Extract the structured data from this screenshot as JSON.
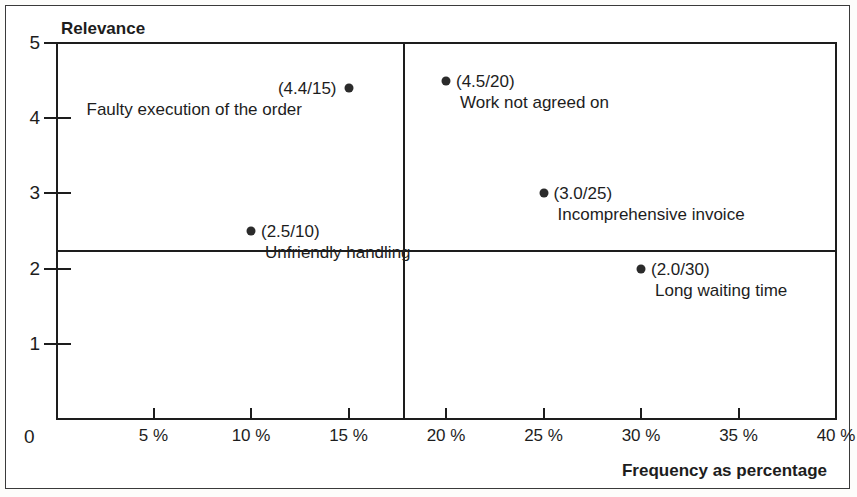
{
  "chart_data": {
    "type": "scatter",
    "title": "",
    "subtitle": "",
    "xlabel": "Frequency as percentage",
    "ylabel": "Relevance",
    "origin_label": "0",
    "xlim": [
      0,
      40
    ],
    "ylim": [
      0,
      5
    ],
    "x_ticks": [
      5,
      10,
      15,
      20,
      25,
      30,
      35,
      40
    ],
    "x_tick_labels": [
      "5 %",
      "10 %",
      "15 %",
      "20 %",
      "25 %",
      "30 %",
      "35 %",
      "40 %"
    ],
    "y_ticks": [
      1,
      2,
      3,
      4,
      5
    ],
    "y_tick_labels": [
      "1",
      "2",
      "3",
      "4",
      "5"
    ],
    "grid": false,
    "legend": "none",
    "quadrant_divider_x": 17.8,
    "quadrant_divider_y": 2.35,
    "points": [
      {
        "label": "Faulty execution of the order",
        "value_label": "(4.4/15)",
        "x": 15,
        "y": 4.4,
        "value_align": "right",
        "name_align": "left"
      },
      {
        "label": "Work not agreed on",
        "value_label": "(4.5/20)",
        "x": 20,
        "y": 4.5,
        "value_align": "left",
        "name_align": "left"
      },
      {
        "label": "Unfriendly handling",
        "value_label": "(2.5/10)",
        "x": 10,
        "y": 2.5,
        "value_align": "left",
        "name_align": "left"
      },
      {
        "label": "Incomprehensive invoice",
        "value_label": "(3.0/25)",
        "x": 25,
        "y": 3.0,
        "value_align": "left",
        "name_align": "left"
      },
      {
        "label": "Long waiting time",
        "value_label": "(2.0/30)",
        "x": 30,
        "y": 2.0,
        "value_align": "left",
        "name_align": "left"
      }
    ],
    "colors": {
      "marker": "#2b2b2b",
      "axis": "#1d1d1d",
      "text": "#1d1d1d",
      "background": "#ffffff",
      "frame": "#3a3a3a"
    }
  }
}
